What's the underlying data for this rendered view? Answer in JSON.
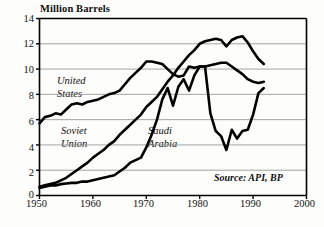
{
  "chart_data": {
    "type": "line",
    "title": "",
    "ylabel": "Million Barrels",
    "xlabel": "",
    "xlim": [
      1950,
      2000
    ],
    "ylim": [
      0,
      14
    ],
    "grid": true,
    "legend_position": "inline-annotations",
    "xticks": [
      "1950",
      "1960",
      "1970",
      "1980",
      "1990",
      "2000"
    ],
    "xtick_values": [
      1950,
      1960,
      1970,
      1980,
      1990,
      2000
    ],
    "yticks": [
      "0",
      "2",
      "4",
      "6",
      "8",
      "10",
      "12",
      "14"
    ],
    "ytick_values": [
      0,
      2,
      4,
      6,
      8,
      10,
      12,
      14
    ],
    "annotation": "Source: API, BP",
    "series": [
      {
        "name": "United States",
        "label": "United States",
        "label_line1": "United",
        "label_line2": "States",
        "x": [
          1950,
          1951,
          1952,
          1953,
          1954,
          1955,
          1956,
          1957,
          1958,
          1959,
          1960,
          1961,
          1962,
          1963,
          1964,
          1965,
          1966,
          1967,
          1968,
          1969,
          1970,
          1971,
          1972,
          1973,
          1974,
          1975,
          1976,
          1977,
          1978,
          1979,
          1980,
          1981,
          1982,
          1983,
          1984,
          1985,
          1986,
          1987,
          1988,
          1989,
          1990,
          1991,
          1992
        ],
        "values": [
          5.7,
          6.2,
          6.3,
          6.5,
          6.4,
          6.8,
          7.2,
          7.3,
          7.2,
          7.4,
          7.5,
          7.6,
          7.8,
          8.0,
          8.1,
          8.3,
          8.8,
          9.3,
          9.7,
          10.1,
          10.6,
          10.6,
          10.5,
          10.4,
          10.0,
          9.6,
          9.4,
          9.5,
          10.2,
          10.1,
          10.2,
          10.2,
          10.3,
          10.4,
          10.5,
          10.5,
          10.2,
          9.9,
          9.6,
          9.2,
          9.0,
          8.9,
          9.0
        ]
      },
      {
        "name": "Soviet Union",
        "label": "Soviet Union",
        "label_line1": "Soviet",
        "label_line2": "Union",
        "x": [
          1950,
          1951,
          1952,
          1953,
          1954,
          1955,
          1956,
          1957,
          1958,
          1959,
          1960,
          1961,
          1962,
          1963,
          1964,
          1965,
          1966,
          1967,
          1968,
          1969,
          1970,
          1971,
          1972,
          1973,
          1974,
          1975,
          1976,
          1977,
          1978,
          1979,
          1980,
          1981,
          1982,
          1983,
          1984,
          1985,
          1986,
          1987,
          1988,
          1989,
          1990,
          1991,
          1992
        ],
        "values": [
          0.7,
          0.8,
          0.9,
          1.0,
          1.2,
          1.4,
          1.7,
          2.0,
          2.3,
          2.6,
          3.0,
          3.3,
          3.6,
          4.0,
          4.3,
          4.8,
          5.2,
          5.6,
          6.0,
          6.4,
          7.0,
          7.4,
          7.8,
          8.4,
          9.0,
          9.5,
          10.1,
          10.6,
          11.1,
          11.5,
          12.0,
          12.2,
          12.3,
          12.4,
          12.3,
          11.8,
          12.3,
          12.5,
          12.6,
          12.1,
          11.4,
          10.8,
          10.4
        ]
      },
      {
        "name": "Saudi Arabia",
        "label": "Saudi Arabia",
        "label_line1": "Saudi",
        "label_line2": "Arabia",
        "x": [
          1950,
          1951,
          1952,
          1953,
          1954,
          1955,
          1956,
          1957,
          1958,
          1959,
          1960,
          1961,
          1962,
          1963,
          1964,
          1965,
          1966,
          1967,
          1968,
          1969,
          1970,
          1971,
          1972,
          1973,
          1974,
          1975,
          1976,
          1977,
          1978,
          1979,
          1980,
          1981,
          1982,
          1983,
          1984,
          1985,
          1986,
          1987,
          1988,
          1989,
          1990,
          1991,
          1992
        ],
        "values": [
          0.6,
          0.7,
          0.8,
          0.8,
          0.9,
          0.95,
          1.0,
          1.0,
          1.1,
          1.1,
          1.2,
          1.3,
          1.4,
          1.5,
          1.6,
          1.9,
          2.2,
          2.6,
          2.8,
          3.0,
          3.8,
          4.8,
          6.0,
          7.6,
          8.5,
          7.1,
          8.6,
          9.2,
          8.3,
          9.5,
          10.2,
          10.2,
          6.5,
          5.1,
          4.7,
          3.6,
          5.2,
          4.5,
          5.1,
          5.2,
          6.4,
          8.1,
          8.5
        ]
      }
    ]
  },
  "axis": {
    "ylabel": "Million Barrels"
  },
  "source": {
    "text": "Source: API, BP"
  }
}
